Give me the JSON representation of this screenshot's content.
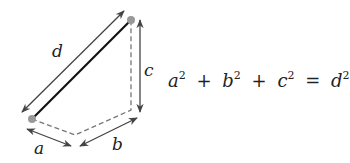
{
  "diagram": {
    "labels": {
      "d": "d",
      "c": "c",
      "a": "a",
      "b": "b"
    },
    "colors": {
      "diagonal": "#111111",
      "dashed": "#777777",
      "arrow": "#444444",
      "point": "#999999"
    }
  },
  "equation": {
    "terms": [
      {
        "base": "a",
        "exp": "2"
      },
      {
        "base": "b",
        "exp": "2"
      },
      {
        "base": "c",
        "exp": "2"
      }
    ],
    "plus": "+",
    "equals": "=",
    "rhs": {
      "base": "d",
      "exp": "2"
    }
  }
}
